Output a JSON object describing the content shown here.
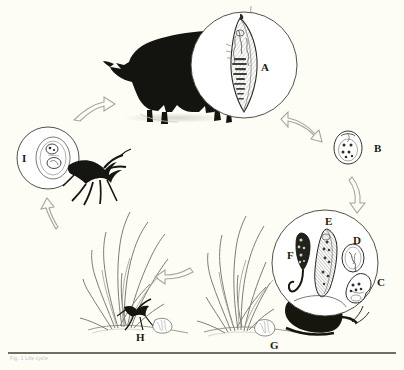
{
  "figure": {
    "background_color": "#fdfdf6",
    "ink_color": "#1a1a16",
    "line_color": "#6e6e63",
    "arrow_outline_color": "#9a9a90",
    "caption": "Fig. 1   Life cycle"
  },
  "labels": {
    "a": "A",
    "b": "B",
    "c": "C",
    "d": "D",
    "e": "E",
    "f": "F",
    "g": "G",
    "h": "H",
    "i": "I"
  },
  "stages": [
    {
      "id": "A",
      "label": "A",
      "icon": "adult-fluke-in-circle",
      "description": "Adult fluke inside magnifier circle over definitive host"
    },
    {
      "id": "B",
      "label": "B",
      "icon": "egg-with-miracidium",
      "description": "Operculate egg containing miracidium"
    },
    {
      "id": "C",
      "label": "C",
      "icon": "sporocyst",
      "description": "Sporocyst in snail tissue"
    },
    {
      "id": "D",
      "label": "D",
      "icon": "daughter-sporocyst",
      "description": "Daughter sporocyst"
    },
    {
      "id": "E",
      "label": "E",
      "icon": "cercaria",
      "description": "Cercaria developing in snail"
    },
    {
      "id": "F",
      "label": "F",
      "icon": "tailed-cercaria",
      "description": "Tailed cercaria escaping snail"
    },
    {
      "id": "G",
      "label": "G",
      "icon": "snail-on-grass",
      "description": "Snail on vegetation shedding slime ball"
    },
    {
      "id": "H",
      "label": "H",
      "icon": "ant-with-slimeball",
      "description": "Ant ingesting slime ball at grass base"
    },
    {
      "id": "I",
      "label": "I",
      "icon": "metacercaria-in-ant",
      "description": "Encysted metacercaria inside ant"
    }
  ],
  "hosts": [
    {
      "id": "definitive-host",
      "icon": "bull-silhouette",
      "description": "Grazing bovine definitive host"
    },
    {
      "id": "first-intermediate-host",
      "icon": "snail-silhouette",
      "description": "Land snail first intermediate host"
    },
    {
      "id": "second-intermediate-host",
      "icon": "ant-silhouette",
      "description": "Ant second intermediate host"
    }
  ],
  "arrows": [
    {
      "id": "arrow-i-to-host",
      "icon": "arrow-curved-right",
      "from": "I",
      "to": "A",
      "direction": "right"
    },
    {
      "id": "arrow-host-to-b",
      "icon": "arrow-curved-down-right",
      "from": "A",
      "to": "B",
      "direction": "down-right"
    },
    {
      "id": "arrow-b-to-g",
      "icon": "arrow-curved-down",
      "from": "B",
      "to": "G",
      "direction": "down"
    },
    {
      "id": "arrow-g-to-h",
      "icon": "arrow-curved-left",
      "from": "G",
      "to": "H",
      "direction": "left"
    },
    {
      "id": "arrow-h-to-i",
      "icon": "arrow-curved-up",
      "from": "H",
      "to": "I",
      "direction": "up"
    }
  ]
}
